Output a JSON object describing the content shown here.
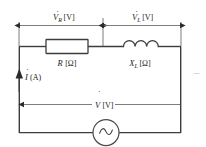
{
  "diagram": {
    "colors": {
      "wire": "#3d3d3d",
      "dimension_line": "#6e6e6e",
      "text": "#1b1b1b",
      "background": "#ffffff"
    },
    "dimension_labels": [
      {
        "id": "v-r",
        "symbol": "V",
        "subscript": "R",
        "unit": "[V]",
        "dot": true,
        "span": "across resistor"
      },
      {
        "id": "v-l",
        "symbol": "V",
        "subscript": "L",
        "unit": "[V]",
        "dot": true,
        "span": "across inductor"
      }
    ],
    "components": [
      {
        "id": "resistor",
        "type": "resistor",
        "symbol": "R",
        "subscript": "",
        "unit": "[Ω]"
      },
      {
        "id": "inductor",
        "type": "inductor",
        "symbol": "X",
        "subscript": "L",
        "unit": "[Ω]"
      },
      {
        "id": "source",
        "type": "ac-source",
        "symbol": "",
        "unit": ""
      }
    ],
    "current": {
      "id": "current",
      "symbol": "I",
      "unit": "(A)",
      "dot": true,
      "direction": "up"
    },
    "total_voltage": {
      "id": "v-total",
      "symbol": "V",
      "unit": "[V]",
      "dot": true,
      "direction": "left"
    },
    "edge_artifact": "一"
  }
}
